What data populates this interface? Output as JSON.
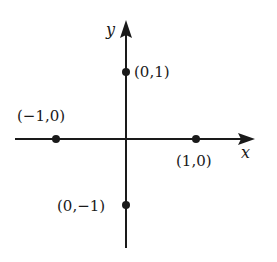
{
  "diagram": {
    "type": "coordinate-plane",
    "axes": {
      "x": {
        "label": "x",
        "color": "#1a1a1a"
      },
      "y": {
        "label": "y",
        "color": "#1a1a1a"
      }
    },
    "points": [
      {
        "id": "p-0-1",
        "coords": [
          0,
          1
        ],
        "label": "(0,1)"
      },
      {
        "id": "p-neg1-0",
        "coords": [
          -1,
          0
        ],
        "label": "(−1,0)"
      },
      {
        "id": "p-1-0",
        "coords": [
          1,
          0
        ],
        "label": "(1,0)"
      },
      {
        "id": "p-0-neg1",
        "coords": [
          0,
          -1
        ],
        "label": "(0,−1)"
      }
    ],
    "point_color": "#1a1a1a",
    "background": "#ffffff"
  }
}
